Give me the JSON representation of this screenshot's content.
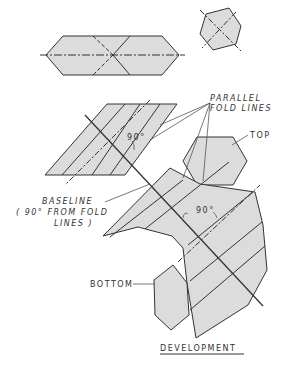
{
  "diagram": {
    "title": "DEVELOPMENT",
    "labels": {
      "parallel_1": "PARALLEL",
      "parallel_2": "FOLD LINES",
      "top": "TOP",
      "baseline": "BASELINE",
      "baseline_note_1": "( 90° FROM FOLD",
      "baseline_note_2": "LINES )",
      "angle_small": "90°",
      "angle_large": "90°",
      "bottom": "BOTTOM"
    },
    "colors": {
      "fill": "#dcdcdc",
      "stroke": "#333333",
      "background": "#ffffff"
    }
  }
}
